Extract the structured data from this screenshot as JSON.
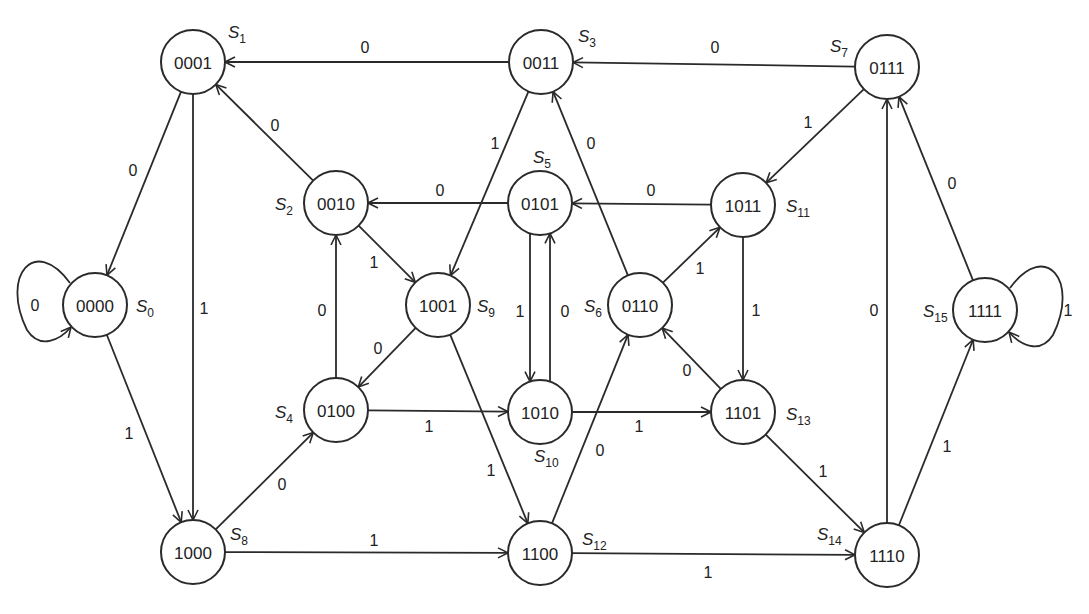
{
  "diagram": {
    "type": "state-transition-diagram",
    "nodes": [
      {
        "id": "S0",
        "name": "S",
        "sub": "0",
        "code": "0000",
        "x": 95,
        "y": 305,
        "lx": 136,
        "ly": 312
      },
      {
        "id": "S1",
        "name": "S",
        "sub": "1",
        "code": "0001",
        "x": 193,
        "y": 62,
        "lx": 228,
        "ly": 38
      },
      {
        "id": "S2",
        "name": "S",
        "sub": "2",
        "code": "0010",
        "x": 336,
        "y": 203,
        "lx": 275,
        "ly": 210
      },
      {
        "id": "S3",
        "name": "S",
        "sub": "3",
        "code": "0011",
        "x": 541,
        "y": 62,
        "lx": 578,
        "ly": 42
      },
      {
        "id": "S4",
        "name": "S",
        "sub": "4",
        "code": "0100",
        "x": 336,
        "y": 410,
        "lx": 275,
        "ly": 418
      },
      {
        "id": "S5",
        "name": "S",
        "sub": "5",
        "code": "0101",
        "x": 540,
        "y": 203,
        "lx": 533,
        "ly": 163
      },
      {
        "id": "S6",
        "name": "S",
        "sub": "6",
        "code": "0110",
        "x": 640,
        "y": 305,
        "lx": 584,
        "ly": 312
      },
      {
        "id": "S7",
        "name": "S",
        "sub": "7",
        "code": "0111",
        "x": 887,
        "y": 67,
        "lx": 830,
        "ly": 52
      },
      {
        "id": "S8",
        "name": "S",
        "sub": "8",
        "code": "1000",
        "x": 193,
        "y": 552,
        "lx": 230,
        "ly": 540
      },
      {
        "id": "S9",
        "name": "S",
        "sub": "9",
        "code": "1001",
        "x": 438,
        "y": 305,
        "lx": 477,
        "ly": 312
      },
      {
        "id": "S10",
        "name": "S",
        "sub": "10",
        "code": "1010",
        "x": 540,
        "y": 412,
        "lx": 534,
        "ly": 462
      },
      {
        "id": "S11",
        "name": "S",
        "sub": "11",
        "code": "1011",
        "x": 743,
        "y": 205,
        "lx": 786,
        "ly": 212
      },
      {
        "id": "S12",
        "name": "S",
        "sub": "12",
        "code": "1100",
        "x": 540,
        "y": 553,
        "lx": 582,
        "ly": 545
      },
      {
        "id": "S13",
        "name": "S",
        "sub": "13",
        "code": "1101",
        "x": 743,
        "y": 412,
        "lx": 786,
        "ly": 420
      },
      {
        "id": "S14",
        "name": "S",
        "sub": "14",
        "code": "1110",
        "x": 887,
        "y": 555,
        "lx": 817,
        "ly": 540
      },
      {
        "id": "S15",
        "name": "S",
        "sub": "15",
        "code": "1111",
        "x": 985,
        "y": 310,
        "lx": 923,
        "ly": 317
      }
    ],
    "edges": [
      {
        "from": "S3",
        "to": "S1",
        "label": "0",
        "lx": 365,
        "ly": 47
      },
      {
        "from": "S7",
        "to": "S3",
        "label": "0",
        "lx": 715,
        "ly": 47
      },
      {
        "from": "S1",
        "to": "S0",
        "label": "0",
        "lx": 133,
        "ly": 170
      },
      {
        "from": "S1",
        "to": "S8",
        "label": "1",
        "lx": 204,
        "ly": 308
      },
      {
        "from": "S2",
        "to": "S1",
        "label": "0",
        "lx": 275,
        "ly": 125
      },
      {
        "from": "S3",
        "to": "S9",
        "label": "1",
        "lx": 495,
        "ly": 143
      },
      {
        "from": "S6",
        "to": "S3",
        "label": "0",
        "lx": 591,
        "ly": 143
      },
      {
        "from": "S5",
        "to": "S2",
        "label": "0",
        "lx": 440,
        "ly": 190
      },
      {
        "from": "S11",
        "to": "S5",
        "label": "0",
        "lx": 651,
        "ly": 190
      },
      {
        "from": "S7",
        "to": "S11",
        "label": "1",
        "lx": 808,
        "ly": 122
      },
      {
        "from": "S2",
        "to": "S9",
        "label": "1",
        "lx": 374,
        "ly": 262
      },
      {
        "from": "S4",
        "to": "S2",
        "label": "0",
        "lx": 322,
        "ly": 310
      },
      {
        "from": "S9",
        "to": "S4",
        "label": "0",
        "lx": 378,
        "ly": 348
      },
      {
        "from": "S5",
        "to": "S10",
        "label": "1",
        "lx": 520,
        "ly": 311
      },
      {
        "from": "S10",
        "to": "S5",
        "label": "0",
        "lx": 565,
        "ly": 311
      },
      {
        "from": "S6",
        "to": "S11",
        "label": "1",
        "lx": 700,
        "ly": 268
      },
      {
        "from": "S11",
        "to": "S13",
        "label": "1",
        "lx": 756,
        "ly": 310
      },
      {
        "from": "S13",
        "to": "S6",
        "label": "0",
        "lx": 687,
        "ly": 370
      },
      {
        "from": "S4",
        "to": "S10",
        "label": "1",
        "lx": 429,
        "ly": 426
      },
      {
        "from": "S10",
        "to": "S13",
        "label": "1",
        "lx": 639,
        "ly": 426
      },
      {
        "from": "S9",
        "to": "S12",
        "label": "1",
        "lx": 491,
        "ly": 470
      },
      {
        "from": "S12",
        "to": "S6",
        "label": "0",
        "lx": 600,
        "ly": 450
      },
      {
        "from": "S0",
        "to": "S8",
        "label": "1",
        "lx": 129,
        "ly": 433
      },
      {
        "from": "S8",
        "to": "S4",
        "label": "0",
        "lx": 282,
        "ly": 484
      },
      {
        "from": "S8",
        "to": "S12",
        "label": "1",
        "lx": 374,
        "ly": 540
      },
      {
        "from": "S12",
        "to": "S14",
        "label": "1",
        "lx": 708,
        "ly": 572
      },
      {
        "from": "S13",
        "to": "S14",
        "label": "1",
        "lx": 823,
        "ly": 471
      },
      {
        "from": "S14",
        "to": "S7",
        "label": "0",
        "lx": 874,
        "ly": 310
      },
      {
        "from": "S14",
        "to": "S15",
        "label": "1",
        "lx": 947,
        "ly": 446
      },
      {
        "from": "S15",
        "to": "S7",
        "label": "0",
        "lx": 952,
        "ly": 183
      }
    ],
    "self_loops": [
      {
        "node": "S0",
        "label": "0",
        "side": "left",
        "lx": 35,
        "ly": 305
      },
      {
        "node": "S15",
        "label": "1",
        "side": "right",
        "lx": 1068,
        "ly": 310
      }
    ],
    "colors": {
      "stroke": "#2a2a2a",
      "background": "#ffffff",
      "text": "#222222"
    }
  }
}
